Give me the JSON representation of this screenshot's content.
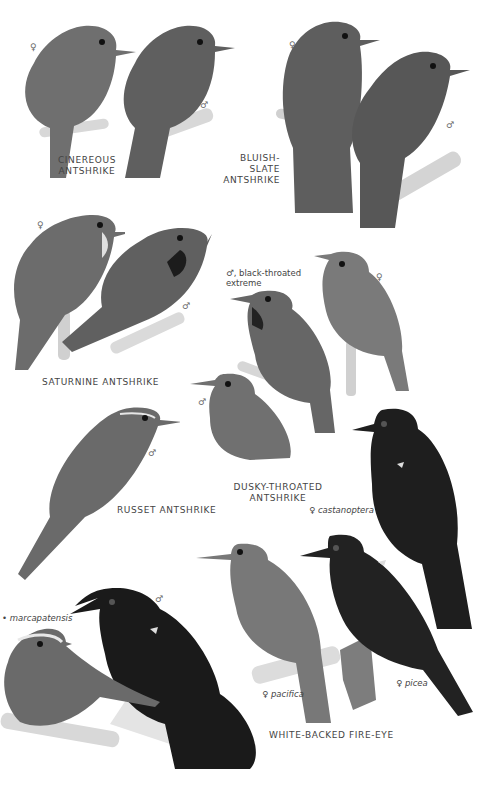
{
  "plate": {
    "species": [
      {
        "name": "CINEREOUS ANTSHRIKE",
        "name_lines": [
          "CINEREOUS",
          "ANTSHRIKE"
        ],
        "figures": [
          {
            "sex": "♀",
            "tone": "#6f6f6f"
          },
          {
            "sex": "♂",
            "tone": "#5f5f5f"
          }
        ]
      },
      {
        "name": "BLUISH-SLATE ANTSHRIKE",
        "name_lines": [
          "BLUISH-SLATE",
          "ANTSHRIKE"
        ],
        "figures": [
          {
            "sex": "♀",
            "tone": "#5e5e5e"
          },
          {
            "sex": "♂",
            "tone": "#575757"
          }
        ]
      },
      {
        "name": "SATURNINE ANTSHRIKE",
        "name_lines": [
          "SATURNINE ANTSHRIKE"
        ],
        "figures": [
          {
            "sex": "♀",
            "tone": "#6c6c6c"
          },
          {
            "sex": "♂",
            "tone": "#606060"
          }
        ]
      },
      {
        "name": "DUSKY-THROATED ANTSHRIKE",
        "name_lines": [
          "DUSKY-THROATED",
          "ANTSHRIKE"
        ],
        "figures": [
          {
            "sex": "♂",
            "note": "black-throated extreme",
            "note_lines": [
              ", black-throated",
              "extreme"
            ],
            "tone": "#666"
          },
          {
            "sex": "♀",
            "tone": "#7a7a7a"
          },
          {
            "sex": "♂",
            "tone": "#707070"
          }
        ]
      },
      {
        "name": "RUSSET ANTSHRIKE",
        "name_lines": [
          "RUSSET ANTSHRIKE"
        ],
        "figures": [
          {
            "sex": "♂",
            "tone": "#6a6a6a"
          }
        ]
      },
      {
        "name": "WHITE-BACKED FIRE-EYE",
        "name_lines": [
          "WHITE-BACKED FIRE-EYE"
        ],
        "figures": [
          {
            "sex": "♀",
            "subspecies": "castanoptera",
            "tone": "#1e1e1e"
          },
          {
            "sex": "♂",
            "tone": "#1a1a1a"
          },
          {
            "sex": "",
            "subspecies": "marcapatensis",
            "tone": "#6a6a6a"
          },
          {
            "sex": "♀",
            "subspecies": "pacifica",
            "tone": "#787878"
          },
          {
            "sex": "♀",
            "subspecies": "picea",
            "tone": "#222"
          }
        ]
      }
    ]
  }
}
